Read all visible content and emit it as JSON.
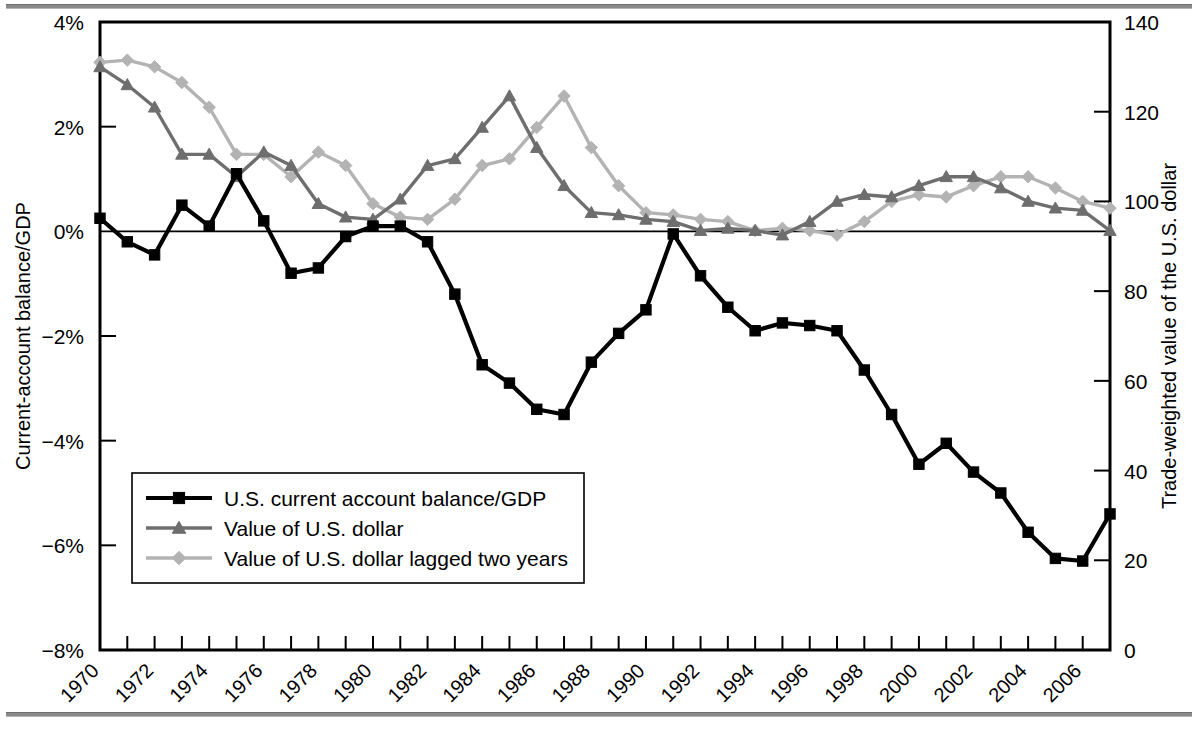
{
  "figure": {
    "background": "#ffffff",
    "frame_color": "#000000"
  },
  "axes": {
    "left": {
      "title": "Current-account balance/GDP",
      "ticks": [
        "4%",
        "2%",
        "0%",
        "−2%",
        "−4%",
        "−6%",
        "−8%"
      ],
      "values": [
        4,
        2,
        0,
        -2,
        -4,
        -6,
        -8
      ],
      "min": -8,
      "max": 4
    },
    "right": {
      "title": "Trade-weighted value of the U.S. dollar",
      "ticks": [
        "140",
        "120",
        "100",
        "80",
        "60",
        "40",
        "20",
        "0"
      ],
      "values": [
        140,
        120,
        100,
        80,
        60,
        40,
        20,
        0
      ],
      "min": 0,
      "max": 140
    },
    "bottom": {
      "tick_labels": [
        "1970",
        "1972",
        "1974",
        "1976",
        "1978",
        "1980",
        "1982",
        "1984",
        "1986",
        "1988",
        "1990",
        "1992",
        "1994",
        "1996",
        "1998",
        "2000",
        "2002",
        "2004",
        "2006"
      ],
      "min": 1970,
      "max": 2007
    }
  },
  "legend": {
    "items": [
      {
        "label": "U.S. current account balance/GDP",
        "marker": "square",
        "color": "#000000"
      },
      {
        "label": "Value of U.S. dollar",
        "marker": "triangle",
        "color": "#6e6e6e"
      },
      {
        "label": "Value of U.S. dollar lagged two years",
        "marker": "diamond",
        "color": "#b3b3b3"
      }
    ]
  },
  "chart_data": {
    "type": "line",
    "title": "",
    "xlabel": "",
    "ylabel": "Current-account balance/GDP",
    "y2label": "Trade-weighted value of the U.S. dollar",
    "xlim": [
      1970,
      2007
    ],
    "ylim": [
      -8,
      4
    ],
    "y2lim": [
      0,
      140
    ],
    "grid": false,
    "legend_position": "lower-left",
    "x": [
      1970,
      1971,
      1972,
      1973,
      1974,
      1975,
      1976,
      1977,
      1978,
      1979,
      1980,
      1981,
      1982,
      1983,
      1984,
      1985,
      1986,
      1987,
      1988,
      1989,
      1990,
      1991,
      1992,
      1993,
      1994,
      1995,
      1996,
      1997,
      1998,
      1999,
      2000,
      2001,
      2002,
      2003,
      2004,
      2005,
      2006,
      2007
    ],
    "series": [
      {
        "name": "U.S. current account balance/GDP",
        "axis": "left",
        "units": "percent of GDP",
        "marker": "square",
        "color": "#000000",
        "values": [
          0.25,
          -0.2,
          -0.45,
          0.5,
          0.1,
          1.1,
          0.2,
          -0.8,
          -0.7,
          -0.1,
          0.1,
          0.1,
          -0.2,
          -1.2,
          -2.55,
          -2.9,
          -3.4,
          -3.5,
          -2.5,
          -1.95,
          -1.5,
          -0.05,
          -0.85,
          -1.45,
          -1.9,
          -1.75,
          -1.8,
          -1.9,
          -2.65,
          -3.5,
          -4.45,
          -4.05,
          -4.6,
          -5.0,
          -5.75,
          -6.25,
          -6.3,
          -5.4
        ]
      },
      {
        "name": "Value of U.S. dollar",
        "axis": "right",
        "units": "index",
        "marker": "triangle",
        "color": "#6e6e6e",
        "values": [
          130.0,
          126.0,
          121.0,
          110.5,
          110.5,
          105.5,
          111.0,
          108.0,
          99.5,
          96.5,
          96.0,
          100.5,
          108.0,
          109.5,
          116.5,
          123.5,
          112.0,
          103.5,
          97.5,
          97.0,
          96.0,
          95.5,
          93.5,
          94.0,
          93.5,
          92.5,
          95.5,
          100.0,
          101.5,
          101.0,
          103.5,
          105.5,
          105.5,
          103.0,
          100.0,
          98.5,
          98.0,
          93.5
        ]
      },
      {
        "name": "Value of U.S. dollar lagged two years",
        "axis": "right",
        "units": "index",
        "marker": "diamond",
        "color": "#b3b3b3",
        "values": [
          131.0,
          131.5,
          130.0,
          126.5,
          121.0,
          110.5,
          110.5,
          105.5,
          111.0,
          108.0,
          99.5,
          96.5,
          96.0,
          100.5,
          108.0,
          109.5,
          116.5,
          123.5,
          112.0,
          103.5,
          97.5,
          97.0,
          96.0,
          95.5,
          93.5,
          94.0,
          93.5,
          92.5,
          95.5,
          100.0,
          101.5,
          101.0,
          103.5,
          105.5,
          105.5,
          103.0,
          100.0,
          98.5
        ]
      }
    ]
  }
}
